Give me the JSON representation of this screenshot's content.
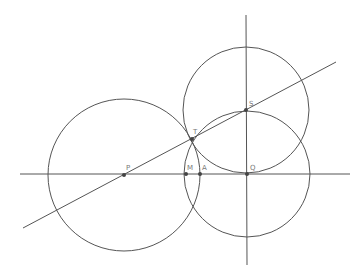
{
  "diagram": {
    "stroke_color": "#555555",
    "point_color": "#444444",
    "lines": {
      "horizontal": {
        "x1": 20,
        "y1": 174,
        "x2": 350,
        "y2": 174
      },
      "vertical": {
        "x1": 246,
        "y1": 15,
        "x2": 247,
        "y2": 265
      },
      "slanted": {
        "x1": 23,
        "y1": 228,
        "x2": 336,
        "y2": 62
      }
    },
    "circles": [
      {
        "name": "circle-p",
        "cx": 124,
        "cy": 175,
        "r": 76
      },
      {
        "name": "circle-q",
        "cx": 247,
        "cy": 174,
        "r": 63
      },
      {
        "name": "circle-s",
        "cx": 246,
        "cy": 110,
        "r": 63
      }
    ],
    "points": [
      {
        "label": "P",
        "x": 124,
        "y": 175,
        "lx": 126,
        "ly": 170
      },
      {
        "label": "M",
        "x": 186,
        "y": 174,
        "lx": 187,
        "ly": 170
      },
      {
        "label": "A",
        "x": 200,
        "y": 174,
        "lx": 202,
        "ly": 170
      },
      {
        "label": "Q",
        "x": 247,
        "y": 174,
        "lx": 250,
        "ly": 170
      },
      {
        "label": "T",
        "x": 192,
        "y": 139,
        "lx": 193,
        "ly": 134
      },
      {
        "label": "S",
        "x": 246,
        "y": 110,
        "lx": 249,
        "ly": 106
      }
    ]
  }
}
